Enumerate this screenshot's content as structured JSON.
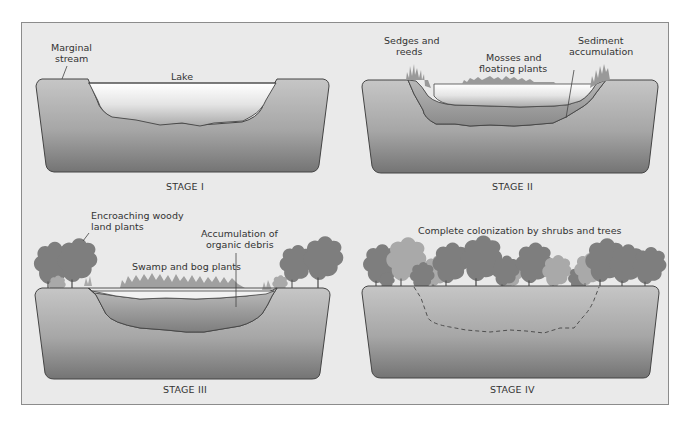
{
  "figure": {
    "colors": {
      "background": "#eaeaea",
      "frame_border": "#8c8c8c",
      "ground_top": "#c4c4c4",
      "ground_bottom": "#7a7a7a",
      "water_top": "#ffffff",
      "water_bottom": "#b0b0b0",
      "sediment": "#9a9a9a",
      "tree_dark": "#7c7c7c",
      "tree_light": "#a8a8a8",
      "text": "#333333"
    },
    "stages": [
      {
        "caption": "STAGE I",
        "labels": {
          "marginal_stream_1": "Marginal",
          "marginal_stream_2": "stream",
          "lake": "Lake"
        }
      },
      {
        "caption": "STAGE II",
        "labels": {
          "sedges_1": "Sedges and",
          "sedges_2": "reeds",
          "mosses_1": "Mosses and",
          "mosses_2": "floating plants",
          "sediment_1": "Sediment",
          "sediment_2": "accumulation"
        }
      },
      {
        "caption": "STAGE III",
        "labels": {
          "woody_1": "Encroaching woody",
          "woody_2": "land plants",
          "debris_1": "Accumulation of",
          "debris_2": "organic debris",
          "swamp": "Swamp and bog plants"
        }
      },
      {
        "caption": "STAGE IV",
        "labels": {
          "colonization": "Complete colonization by shrubs and trees"
        }
      }
    ]
  }
}
